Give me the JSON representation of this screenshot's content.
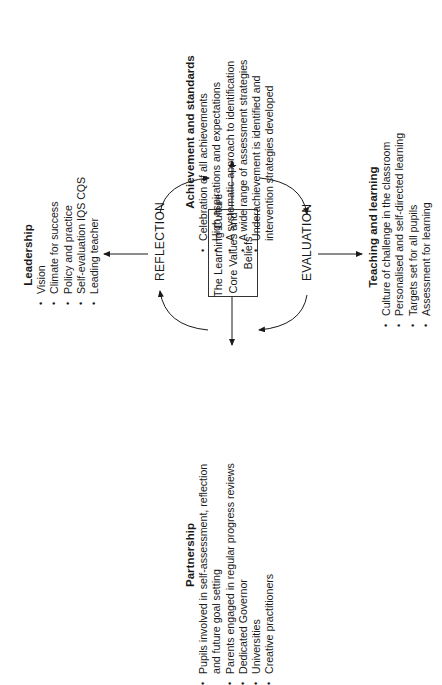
{
  "diagram": {
    "center": {
      "lines": [
        "The Learning Culture",
        "Core Values and",
        "Beliefs"
      ]
    },
    "cycle_labels": {
      "left": "REFLECTION",
      "right": "EVALUATION"
    },
    "sections": {
      "leadership": {
        "title": "Leadership",
        "items": [
          "Vision",
          "Climate for success",
          "Policy and practice",
          "Self-evaluation IQS CQS",
          "Leading teacher"
        ]
      },
      "achievement": {
        "title": "Achievement and standards",
        "items": [
          "Celebration of all achievements",
          "High aspirations and expectations",
          "A systematic approach to identification",
          "A wide range of assessment strategies",
          "Underachievement is identified and",
          "intervention strategies developed"
        ]
      },
      "teaching": {
        "title": "Teaching and learning",
        "items": [
          "Culture of challenge in the classroom",
          "Personalised and self-directed learning",
          "Targets set for all pupils",
          "Assessment for learning"
        ]
      },
      "partnership": {
        "title": "Partnership",
        "items": [
          "Pupils involved in self-assessment, reflection",
          "and future goal setting",
          "Parents engaged in regular progress reviews",
          "Dedicated Governor",
          "Universities",
          "Creative practitioners"
        ]
      }
    },
    "colors": {
      "ink": "#1a1a1a",
      "background": "#ffffff"
    }
  }
}
